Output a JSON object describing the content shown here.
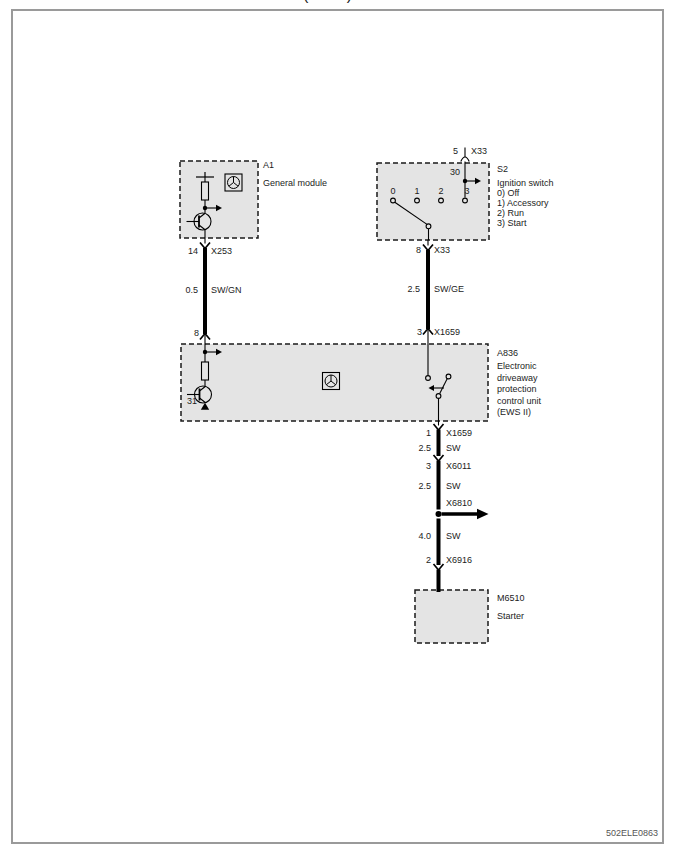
{
  "page": {
    "clipped_title": "( )",
    "doc_id": "502ELE0863"
  },
  "a1": {
    "ref": "A1",
    "name": "General module",
    "pin_out": "14",
    "connector_out": "X253"
  },
  "s2": {
    "ref": "S2",
    "name": "Ignition switch",
    "positions": [
      "0)  Off",
      "1)  Accessory",
      "2)  Run",
      "3)  Start"
    ],
    "terminal": "30",
    "contacts": [
      "0",
      "1",
      "2",
      "3"
    ],
    "pin_top": "5",
    "connector_top": "X33",
    "pin_bottom": "8",
    "connector_bottom": "X33"
  },
  "a836": {
    "ref": "A836",
    "name": "Electronic driveaway protection control unit (EWS II)",
    "pin_in_left": "8",
    "terminal_ground": "31",
    "pin_in_right": "3",
    "connector_in_right": "X1659",
    "pin_out": "1",
    "connector_out": "X1659"
  },
  "m6510": {
    "ref": "M6510",
    "name": "Starter"
  },
  "wires": {
    "a1_a836": {
      "gauge": "0.5",
      "color": "SW/GN"
    },
    "s2_a836": {
      "gauge": "2.5",
      "color": "SW/GE"
    },
    "seg1": {
      "gauge": "2.5",
      "color": "SW"
    },
    "x6011": {
      "pin": "3",
      "connector": "X6011"
    },
    "seg2": {
      "gauge": "2.5",
      "color": "SW"
    },
    "x6810": {
      "connector": "X6810"
    },
    "seg3": {
      "gauge": "4.0",
      "color": "SW"
    },
    "x6916": {
      "pin": "2",
      "connector": "X6916"
    }
  }
}
